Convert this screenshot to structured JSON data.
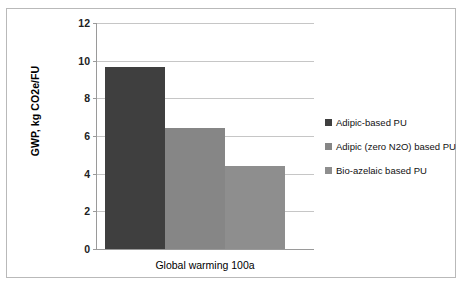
{
  "chart_data": {
    "type": "bar",
    "title": "",
    "xlabel": "",
    "ylabel": "GWP, kg CO2e/FU",
    "categories": [
      "Global warming 100a"
    ],
    "ylim": [
      0,
      12
    ],
    "yticks": [
      0,
      2,
      4,
      6,
      8,
      10,
      12
    ],
    "grid": true,
    "legend_position": "right",
    "series": [
      {
        "name": "Adipic-based PU",
        "values": [
          9.65
        ],
        "color": "#3f3f3f"
      },
      {
        "name": "Adipic (zero N2O) based PU",
        "values": [
          6.45
        ],
        "color": "#868686"
      },
      {
        "name": "Bio-azelaic based PU",
        "values": [
          4.4
        ],
        "color": "#8e8e8e"
      }
    ]
  },
  "axis": {
    "y_title": "GWP, kg CO2e/FU",
    "y_ticks": [
      "12",
      "10",
      "8",
      "6",
      "4",
      "2",
      "0"
    ],
    "x_category": "Global warming 100a"
  },
  "legend": {
    "items": [
      {
        "label": "Adipic-based PU",
        "color": "#3f3f3f"
      },
      {
        "label": "Adipic (zero N2O) based PU",
        "color": "#868686"
      },
      {
        "label": "Bio-azelaic based PU",
        "color": "#8e8e8e"
      }
    ]
  }
}
